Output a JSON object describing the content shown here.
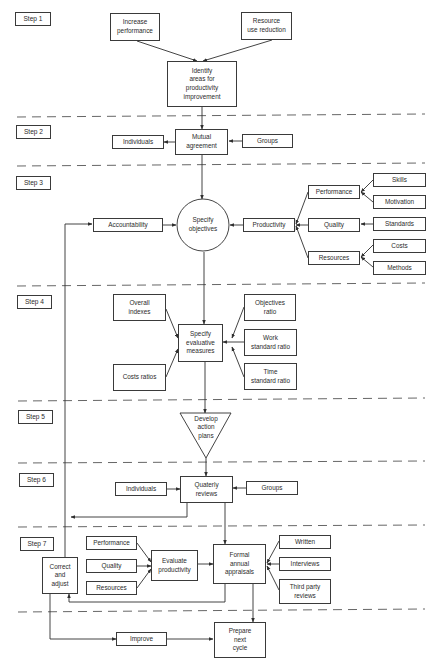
{
  "diagram": {
    "steps": {
      "step1": "Step 1",
      "step2": "Step 2",
      "step3": "Step 3",
      "step4": "Step 4",
      "step5": "Step 5",
      "step6": "Step 6",
      "step7": "Step 7"
    },
    "step1": {
      "increase_performance": "Increase\nperformance",
      "resource_use_reduction": "Resource\nuse reduction",
      "identify_areas": "Identify\nareas for\nproductivity\nimprovement"
    },
    "step2": {
      "individuals": "Individuals",
      "mutual_agreement": "Mutual\nagreement",
      "groups": "Groups"
    },
    "step3": {
      "accountability": "Accountability",
      "specify_objectives": "Specify\nobjectives",
      "productivity": "Productivity",
      "performance": "Performance",
      "quality": "Quality",
      "resources": "Resources",
      "skills": "Skills",
      "motivation": "Motivation",
      "standards": "Standards",
      "costs": "Costs",
      "methods": "Methods"
    },
    "step4": {
      "overall_indexes": "Overall\nindexes",
      "costs_ratios": "Costs ratios",
      "specify_evaluative_measures": "Specify\nevaluative\nmeasures",
      "objectives_ratio": "Objectives\nratio",
      "work_standard_ratio": "Work\nstandard ratio",
      "time_standard_ratio": "Time\nstandard ratio"
    },
    "step5": {
      "develop_action_plans": "Develop\naction\nplans"
    },
    "step6": {
      "individuals": "Individuals",
      "quaterly_reviews": "Quaterly\nreviews",
      "groups": "Groups"
    },
    "step7": {
      "correct_and_adjust": "Correct\nand\nadjust",
      "performance": "Performance",
      "quality": "Quality",
      "resources": "Resources",
      "evaluate_productivity": "Evaluate\nproductivity",
      "formal_annual_appraisals": "Formal\nannual\nappraisals",
      "written": "Written",
      "interviews": "Interviews",
      "third_party_reviews": "Third party\nreviews",
      "improve": "Improve",
      "prepare_next_cycle": "Prepare\nnext\ncycle"
    },
    "colors": {
      "line": "#2f2f2f",
      "dash": "#555555",
      "background": "#ffffff"
    }
  }
}
